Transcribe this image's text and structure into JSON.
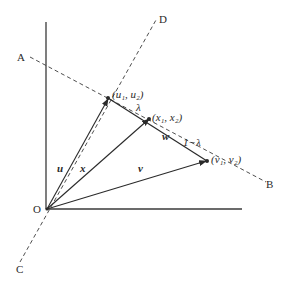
{
  "diagram": {
    "type": "vector-geometry",
    "points": {
      "O": {
        "label": "O"
      },
      "A": {
        "label": "A"
      },
      "B": {
        "label": "B"
      },
      "C": {
        "label": "C"
      },
      "D": {
        "label": "D"
      },
      "u_point": {
        "label": "(u₁, u₂)"
      },
      "x_point": {
        "label": "(x₁, x₂)"
      },
      "v_point": {
        "label": "(v₁, v₂)"
      }
    },
    "vectors": {
      "u": {
        "label": "u"
      },
      "x": {
        "label": "x"
      },
      "v": {
        "label": "v"
      },
      "w": {
        "label": "w"
      }
    },
    "segments": {
      "lambda": {
        "label": "λ"
      },
      "one_minus_lambda": {
        "label": "1−λ"
      }
    },
    "colors": {
      "ink": "#2a2a2a",
      "background": "#ffffff"
    }
  }
}
